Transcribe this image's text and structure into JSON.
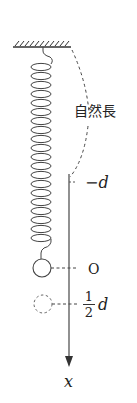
{
  "diagram": {
    "type": "spring-mass vertical oscillation",
    "labels": {
      "natural_length": "自然長",
      "minus_d": "−d",
      "origin": "O",
      "half_numerator": "1",
      "half_denominator": "2",
      "half_d_symbol": "d",
      "axis": "x"
    },
    "elements": {
      "ceiling": "hatched fixed support",
      "spring": "coil spring hanging from ceiling",
      "mass_equilibrium": "solid circle at O",
      "mass_displaced": "dashed circle at 1/2 d",
      "natural_length_indicator": "dashed curved line from ceiling to −d",
      "axis": "downward x-axis with arrow"
    },
    "colors": {
      "line": "#333333",
      "text": "#222222",
      "background": "#ffffff"
    }
  }
}
